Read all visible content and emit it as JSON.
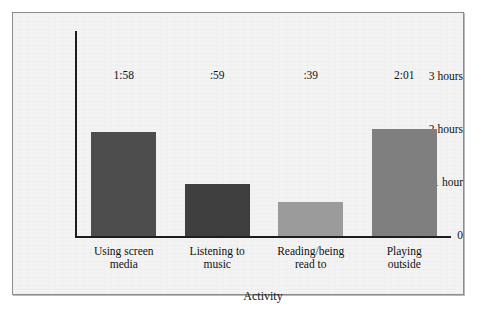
{
  "chart_data": {
    "type": "bar",
    "title": "",
    "subtitle": "",
    "xlabel": "Activity",
    "ylabel": "",
    "categories": [
      "Using screen\nmedia",
      "Listening to\nmusic",
      "Reading/being\nread to",
      "Playing\noutside"
    ],
    "values": [
      1.967,
      0.983,
      0.65,
      2.017
    ],
    "value_labels": [
      "1:58",
      ":59",
      ":39",
      "2:01"
    ],
    "bar_colors": [
      "#4d4d4d",
      "#3f3f3f",
      "#9b9b9b",
      "#7f7f7f"
    ],
    "ylim": [
      0,
      3.3
    ],
    "yticks": [
      0,
      1,
      2,
      3
    ],
    "ytick_labels": [
      "0",
      "1 hour",
      "2 hours",
      "3 hours"
    ],
    "grid": false,
    "legend": null,
    "series": [
      {
        "name": "Average time per day",
        "values": [
          1.967,
          0.983,
          0.65,
          2.017
        ]
      }
    ]
  },
  "figure": {
    "frame_color": "#8d8d8d",
    "background_color": "#f3f3f3",
    "axis_color": "#1d1d1d",
    "text_color": "#111111"
  }
}
